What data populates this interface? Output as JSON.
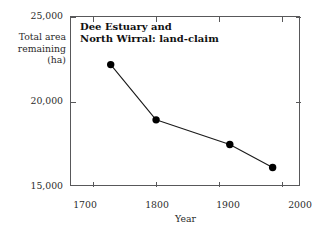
{
  "chart_data": {
    "type": "line",
    "xlabel": "Year",
    "ylabel": "Total area\nremaining\n(ha)",
    "x": [
      1728,
      1800,
      1917,
      1985
    ],
    "values": [
      22200,
      18950,
      17500,
      16150
    ],
    "series": [
      {
        "name": "Total area remaining (ha)",
        "values": [
          22200,
          18950,
          17500,
          16150
        ]
      }
    ],
    "xlim": [
      1665,
      2030
    ],
    "ylim": [
      15000,
      25000
    ],
    "xticks": [
      1700,
      1800,
      1900,
      2000
    ],
    "yticks": [
      25000,
      20000,
      15000
    ],
    "xtick_labels": [
      "1700",
      "1800",
      "1900",
      "2000"
    ],
    "ytick_labels": [
      "25,000",
      "20,000",
      "15,000"
    ],
    "grid": false,
    "legend": "none",
    "marker": "filled-circle",
    "line_color": "#1a1a1a",
    "marker_color": "#000000",
    "frame_color": "#58585a",
    "background": "#ffffff"
  },
  "axis": {
    "y_caption_line1": "Total area",
    "y_caption_line2": "remaining",
    "y_caption_line3": "(ha)",
    "x_caption": "Year"
  },
  "ticks": {
    "y": [
      {
        "label": "25,000",
        "value": 25000
      },
      {
        "label": "20,000",
        "value": 20000
      },
      {
        "label": "15,000",
        "value": 15000
      }
    ],
    "x": [
      {
        "label": "1700",
        "value": 1700
      },
      {
        "label": "1800",
        "value": 1800
      },
      {
        "label": "1900",
        "value": 1900
      },
      {
        "label": "2000",
        "value": 2000
      }
    ]
  },
  "title_lines": {
    "line1": "Dee Estuary and",
    "line2": "North Wirral: land-claim"
  }
}
